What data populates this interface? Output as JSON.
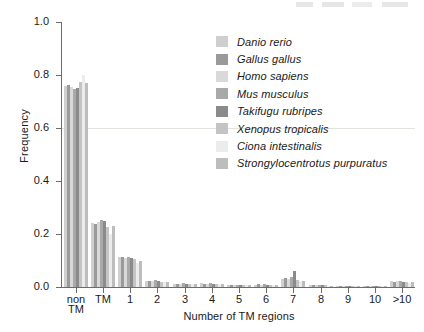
{
  "figure": {
    "background_color": "#ffffff",
    "axis_color": "#6b6b6b"
  },
  "chart_data": {
    "type": "bar",
    "title": "",
    "subtitle": "",
    "xlabel": "Number of TM regions",
    "ylabel": "Frequency",
    "ylim": [
      0.0,
      1.0
    ],
    "yticks": [
      "0.0",
      "0.2",
      "0.4",
      "0.6",
      "0.8",
      "1.0"
    ],
    "ytick_values": [
      0.0,
      0.2,
      0.4,
      0.6,
      0.8,
      1.0
    ],
    "grid": "faint horizontal line at y=0.6 only",
    "legend_position": "upper right, inside axes",
    "categories": [
      "non\nTM",
      "TM",
      "1",
      "2",
      "3",
      "4",
      "5",
      "6",
      "7",
      "8",
      "9",
      "10",
      ">10"
    ],
    "category_labels": [
      "non TM",
      "TM",
      "1",
      "2",
      "3",
      "4",
      "5",
      "6",
      "7",
      "8",
      "9",
      "10",
      ">10"
    ],
    "series": [
      {
        "name": "Danio rerio",
        "color": "#cfcfcf",
        "values": [
          0.757,
          0.243,
          0.113,
          0.022,
          0.012,
          0.014,
          0.007,
          0.009,
          0.03,
          0.006,
          0.004,
          0.004,
          0.022
        ]
      },
      {
        "name": "Gallus gallus",
        "color": "#9a9a9a",
        "values": [
          0.762,
          0.238,
          0.112,
          0.024,
          0.013,
          0.013,
          0.008,
          0.01,
          0.034,
          0.007,
          0.004,
          0.004,
          0.02
        ]
      },
      {
        "name": "Homo sapiens",
        "color": "#d9d9d9",
        "values": [
          0.755,
          0.245,
          0.11,
          0.023,
          0.011,
          0.012,
          0.007,
          0.009,
          0.029,
          0.006,
          0.004,
          0.004,
          0.023
        ]
      },
      {
        "name": "Mus musculus",
        "color": "#a9a9a9",
        "values": [
          0.748,
          0.252,
          0.115,
          0.025,
          0.014,
          0.014,
          0.008,
          0.01,
          0.038,
          0.008,
          0.005,
          0.005,
          0.024
        ]
      },
      {
        "name": "Takifugu rubripes",
        "color": "#8b8b8b",
        "values": [
          0.752,
          0.248,
          0.111,
          0.021,
          0.012,
          0.013,
          0.007,
          0.009,
          0.06,
          0.006,
          0.004,
          0.004,
          0.02
        ]
      },
      {
        "name": "Xenopus tropicalis",
        "color": "#c4c4c4",
        "values": [
          0.775,
          0.225,
          0.104,
          0.02,
          0.011,
          0.012,
          0.006,
          0.008,
          0.026,
          0.006,
          0.003,
          0.004,
          0.019
        ]
      },
      {
        "name": "Ciona intestinalis",
        "color": "#ececec",
        "values": [
          0.8,
          0.2,
          0.092,
          0.018,
          0.01,
          0.011,
          0.006,
          0.007,
          0.021,
          0.005,
          0.003,
          0.003,
          0.016
        ]
      },
      {
        "name": "Strongylocentrotus purpuratus",
        "color": "#bdbdbd",
        "values": [
          0.77,
          0.23,
          0.1,
          0.02,
          0.011,
          0.012,
          0.006,
          0.008,
          0.024,
          0.005,
          0.003,
          0.004,
          0.018
        ]
      }
    ]
  },
  "legend": {
    "items": [
      {
        "label": "Danio rerio",
        "color": "#cfcfcf"
      },
      {
        "label": "Gallus gallus",
        "color": "#9a9a9a"
      },
      {
        "label": "Homo sapiens",
        "color": "#d9d9d9"
      },
      {
        "label": "Mus musculus",
        "color": "#a9a9a9"
      },
      {
        "label": "Takifugu rubripes",
        "color": "#8b8b8b"
      },
      {
        "label": "Xenopus tropicalis",
        "color": "#c4c4c4"
      },
      {
        "label": "Ciona intestinalis",
        "color": "#ececec"
      },
      {
        "label": "Strongylocentrotus purpuratus",
        "color": "#bdbdbd"
      }
    ]
  },
  "axes": {
    "y_title": "Frequency",
    "x_title": "Number of TM regions",
    "y_tick_labels": [
      "1.0",
      "0.8",
      "0.6",
      "0.4",
      "0.2",
      "0.0"
    ],
    "x_tick_labels": [
      "non TM",
      "TM",
      "1",
      "2",
      "3",
      "4",
      "5",
      "6",
      "7",
      "8",
      "9",
      "10",
      ">10"
    ],
    "x_tick_label_first_line": "non",
    "x_tick_label_second_line": "TM"
  }
}
